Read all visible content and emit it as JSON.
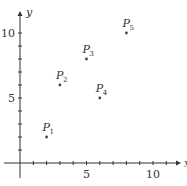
{
  "chart_data": {
    "type": "scatter",
    "title": "",
    "xlabel": "x",
    "ylabel": "y",
    "xlim": [
      -1,
      11.5
    ],
    "ylim": [
      -1,
      11.5
    ],
    "xticks": [
      1,
      2,
      3,
      4,
      5,
      6,
      7,
      8,
      9,
      10,
      11
    ],
    "yticks": [
      1,
      2,
      3,
      4,
      5,
      6,
      7,
      8,
      9,
      10
    ],
    "xtick_labels": [
      {
        "value": 5,
        "label": "5"
      },
      {
        "value": 10,
        "label": "10"
      }
    ],
    "ytick_labels": [
      {
        "value": 5,
        "label": "5"
      },
      {
        "value": 10,
        "label": "10"
      }
    ],
    "grid": false,
    "points": [
      {
        "name": "P",
        "sub": "1",
        "x": 2,
        "y": 2
      },
      {
        "name": "P",
        "sub": "2",
        "x": 3,
        "y": 6
      },
      {
        "name": "P",
        "sub": "3",
        "x": 5,
        "y": 8
      },
      {
        "name": "P",
        "sub": "4",
        "x": 6,
        "y": 5
      },
      {
        "name": "P",
        "sub": "5",
        "x": 8,
        "y": 10
      }
    ]
  }
}
